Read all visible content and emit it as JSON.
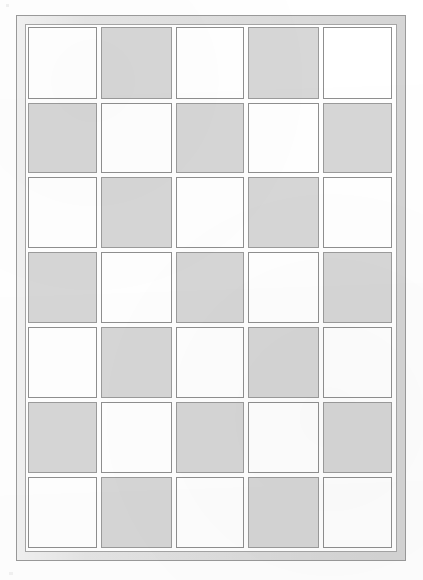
{
  "document": {
    "title": "Grid Panel Drawing",
    "caption": "",
    "background_color": "#ffffff"
  },
  "frame": {
    "outer_border_color": "#9a9a9a",
    "band_color": "#e2e2e2",
    "inner_border_color": "#a5a5a5",
    "outer": {
      "x": 16,
      "y": 15,
      "w": 390,
      "h": 546
    },
    "inner": {
      "x": 25,
      "y": 24,
      "w": 372,
      "h": 528
    }
  },
  "grid": {
    "origin": {
      "x": 28,
      "y": 27
    },
    "columns": 5,
    "rows": 7,
    "cell_border_color": "#8f8f8f",
    "fill_white": "#ffffff",
    "fill_shaded": "#d7d7d7",
    "column_x": [
      0,
      73,
      148,
      220,
      295
    ],
    "column_w": [
      69,
      71,
      68,
      71,
      69
    ],
    "row_y": [
      0,
      76,
      150,
      225,
      300,
      375,
      450
    ],
    "row_h": [
      72,
      70,
      71,
      71,
      71,
      71,
      71
    ],
    "pattern": [
      [
        "white",
        "shaded",
        "white",
        "shaded",
        "white"
      ],
      [
        "shaded",
        "white",
        "shaded",
        "white",
        "shaded"
      ],
      [
        "white",
        "shaded",
        "white",
        "shaded",
        "white"
      ],
      [
        "shaded",
        "white",
        "shaded",
        "white",
        "shaded"
      ],
      [
        "white",
        "shaded",
        "white",
        "shaded",
        "white"
      ],
      [
        "shaded",
        "white",
        "shaded",
        "white",
        "shaded"
      ],
      [
        "white",
        "shaded",
        "white",
        "shaded",
        "white"
      ]
    ],
    "cell_labels": [
      [
        "r1c1",
        "r1c2",
        "r1c3",
        "r1c4",
        "r1c5"
      ],
      [
        "r2c1",
        "r2c2",
        "r2c3",
        "r2c4",
        "r2c5"
      ],
      [
        "r3c1",
        "r3c2",
        "r3c3",
        "r3c4",
        "r3c5"
      ],
      [
        "r4c1",
        "r4c2",
        "r4c3",
        "r4c4",
        "r4c5"
      ],
      [
        "r5c1",
        "r5c2",
        "r5c3",
        "r5c4",
        "r5c5"
      ],
      [
        "r6c1",
        "r6c2",
        "r6c3",
        "r6c4",
        "r6c5"
      ],
      [
        "r7c1",
        "r7c2",
        "r7c3",
        "r7c4",
        "r7c5"
      ]
    ]
  }
}
